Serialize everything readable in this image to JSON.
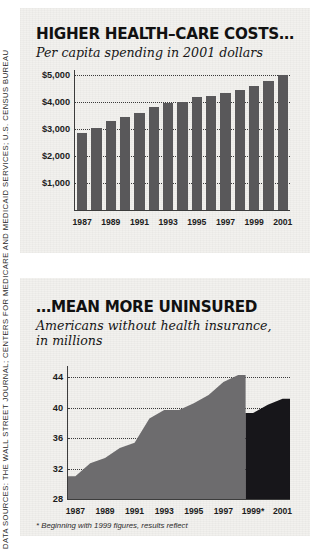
{
  "source_note": "DATA SOURCES: THE WALL STREET JOURNAL; CENTERS FOR MEDICARE AND MEDICAID SERVICES; U.S. CENSUS BUREAU",
  "colors": {
    "paper": "#f2f1ee",
    "bar_fill": "#59585a",
    "area_fill": "#6d6c6e",
    "area_fill_revised": "#17161a",
    "text": "#111111",
    "gridline": "#3a3a3a"
  },
  "panel_costs": {
    "title": "HIGHER HEALTH–CARE COSTS…",
    "subtitle": "Per capita spending in 2001 dollars"
  },
  "panel_uninsured": {
    "title": "…MEAN MORE UNINSURED",
    "subtitle_line1": "Americans without health insurance,",
    "subtitle_line2": "in millions",
    "footnote": "* Beginning with 1999 figures, results reflect"
  },
  "chart_data": [
    {
      "type": "bar",
      "title": "HIGHER HEALTH–CARE COSTS…",
      "subtitle": "Per capita spending in 2001 dollars",
      "xlabel": "",
      "ylabel": "Per capita spending in 2001 dollars",
      "ylim": [
        0,
        5200
      ],
      "ytick_values": [
        1000,
        2000,
        3000,
        4000,
        5000
      ],
      "ytick_labels": [
        "$1,000",
        "$2,000",
        "$3,000",
        "$4,000",
        "$5,000"
      ],
      "grid": true,
      "legend": "none",
      "categories": [
        1987,
        1988,
        1989,
        1990,
        1991,
        1992,
        1993,
        1994,
        1995,
        1996,
        1997,
        1998,
        1999,
        2000,
        2001
      ],
      "xtick_labels": [
        "1987",
        "1989",
        "1991",
        "1993",
        "1995",
        "1997",
        "1999",
        "2001"
      ],
      "xtick_categories": [
        1987,
        1989,
        1991,
        1993,
        1995,
        1997,
        1999,
        2001
      ],
      "values": [
        2850,
        3060,
        3290,
        3440,
        3620,
        3840,
        3960,
        4000,
        4180,
        4220,
        4350,
        4470,
        4610,
        4800,
        5010
      ]
    },
    {
      "type": "area",
      "title": "…MEAN MORE UNINSURED",
      "subtitle": "Americans without health insurance, in millions",
      "xlabel": "",
      "ylabel": "in millions",
      "ylim": [
        28,
        45.5
      ],
      "ytick_values": [
        28,
        32,
        36,
        40,
        44
      ],
      "ytick_labels": [
        "28",
        "32",
        "36",
        "40",
        "44"
      ],
      "grid": true,
      "legend": "none",
      "xtick_labels": [
        "1987",
        "1989",
        "1991",
        "1993",
        "1995",
        "1997",
        "1999*",
        "2001"
      ],
      "xtick_categories": [
        1987,
        1989,
        1991,
        1993,
        1995,
        1997,
        1999,
        2001
      ],
      "series": [
        {
          "name": "Uninsured (original methodology)",
          "x": [
            1987,
            1988,
            1989,
            1990,
            1991,
            1992,
            1993,
            1994,
            1995,
            1996,
            1997,
            1998
          ],
          "values": [
            31.0,
            32.7,
            33.4,
            34.7,
            35.4,
            38.6,
            39.7,
            39.7,
            40.6,
            41.7,
            43.4,
            44.3
          ]
        },
        {
          "name": "Uninsured (revised methodology, 1999 onward)",
          "x": [
            1999,
            2000,
            2001
          ],
          "values": [
            39.3,
            40.4,
            41.2
          ]
        }
      ]
    }
  ]
}
